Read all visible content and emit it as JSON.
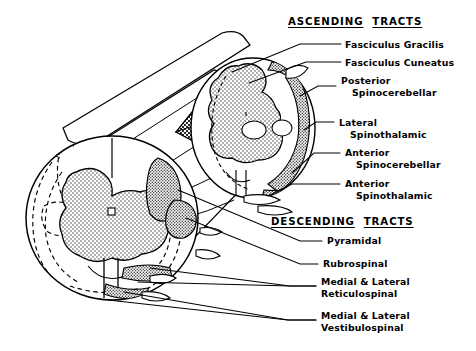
{
  "figure": {
    "background_color": "#ffffff",
    "ink_color": "#000000",
    "gray_matter_fill": "#b8b8b8",
    "tract_fill": "#9a9a9a",
    "hatch_fill": "#6f6f6f"
  },
  "headers": {
    "ascending": {
      "word1": "ASCENDING",
      "word2": "TRACTS"
    },
    "descending": {
      "word1": "DESCENDING",
      "word2": "TRACTS"
    }
  },
  "ascending_labels": [
    {
      "line1": "Fasciculus  Gracilis",
      "line2": ""
    },
    {
      "line1": "Fasciculus  Cuneatus",
      "line2": ""
    },
    {
      "line1": "Posterior",
      "line2": "Spinocerebellar"
    },
    {
      "line1": "Lateral",
      "line2": "Spinothalamic"
    },
    {
      "line1": "Anterior",
      "line2": "Spinocerebellar"
    },
    {
      "line1": "Anterior",
      "line2": "Spinothalamic"
    }
  ],
  "descending_labels": [
    {
      "line1": "Pyramidal",
      "line2": ""
    },
    {
      "line1": "Rubrospinal",
      "line2": ""
    },
    {
      "line1": "Medial  &  Lateral",
      "line2": "Reticulospinal"
    },
    {
      "line1": "Medial  &  Lateral",
      "line2": "Vestibulospinal"
    }
  ]
}
